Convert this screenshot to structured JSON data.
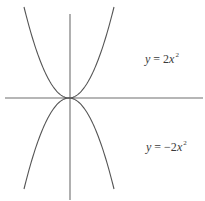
{
  "chart_data": {
    "type": "line",
    "title": "",
    "xlabel": "",
    "ylabel": "",
    "grid": false,
    "legend": null,
    "axes": {
      "x_axis": true,
      "y_axis": true,
      "ticks": false,
      "tick_labels": []
    },
    "series": [
      {
        "name": "y = 2x^2",
        "function": "2*x^2",
        "color": "#555555",
        "label_text": {
          "var": "y",
          "eq": " = 2",
          "xvar": "x",
          "exp": "2"
        }
      },
      {
        "name": "y = -2x^2",
        "function": "-2*x^2",
        "color": "#555555",
        "label_text": {
          "var": "y",
          "eq": " = −2",
          "xvar": "x",
          "exp": "2"
        }
      }
    ],
    "annotations": [
      {
        "text": "y = 2x²",
        "position": "upper right"
      },
      {
        "text": "y = −2x²",
        "position": "lower right"
      }
    ]
  },
  "colors": {
    "axis": "#6e6e6e",
    "curve": "#555555",
    "text": "#3a3a3a",
    "background": "#ffffff"
  }
}
